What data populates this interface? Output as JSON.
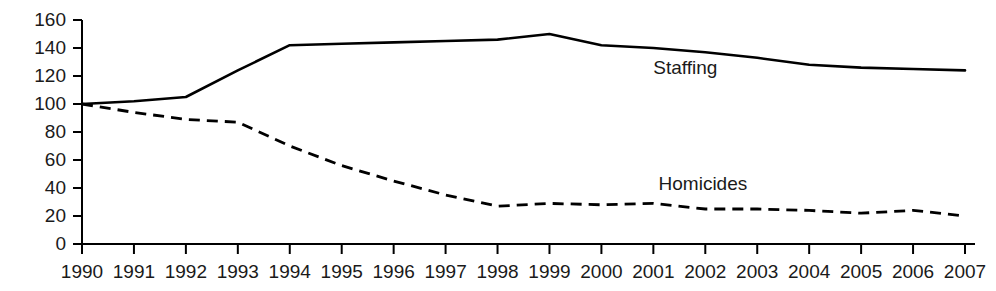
{
  "chart_data": {
    "type": "line",
    "title": "",
    "subtitle": "",
    "xlabel": "",
    "ylabel": "",
    "xlim": [
      1990,
      2007
    ],
    "ylim": [
      0,
      160
    ],
    "grid": false,
    "legend_position": "inline-annotation",
    "categories": [
      1990,
      1991,
      1992,
      1993,
      1994,
      1995,
      1996,
      1997,
      1998,
      1999,
      2000,
      2001,
      2002,
      2003,
      2004,
      2005,
      2006,
      2007
    ],
    "x_tick_labels": [
      "1990",
      "1991",
      "1992",
      "1993",
      "1994",
      "1995",
      "1996",
      "1997",
      "1998",
      "1999",
      "2000",
      "2001",
      "2002",
      "2003",
      "2004",
      "2005",
      "2006",
      "2007"
    ],
    "y_tick_labels": [
      "0",
      "20",
      "40",
      "60",
      "80",
      "100",
      "120",
      "140",
      "160"
    ],
    "y_ticks": [
      0,
      20,
      40,
      60,
      80,
      100,
      120,
      140,
      160
    ],
    "series": [
      {
        "name": "Staffing",
        "style": "solid",
        "color": "#000000",
        "annotation": "Staffing",
        "values": [
          100,
          102,
          105,
          124,
          142,
          143,
          144,
          145,
          146,
          150,
          142,
          140,
          137,
          133,
          128,
          126,
          125,
          124
        ]
      },
      {
        "name": "Homicides",
        "style": "dashed",
        "color": "#000000",
        "annotation": "Homicides",
        "values": [
          100,
          94,
          89,
          87,
          70,
          56,
          45,
          35,
          27,
          29,
          28,
          29,
          25,
          25,
          24,
          22,
          24,
          20
        ]
      }
    ],
    "annotations": [
      {
        "text": "Staffing",
        "x": 2001.0,
        "y": 125
      },
      {
        "text": "Homicides",
        "x": 2001.1,
        "y": 42
      }
    ]
  }
}
